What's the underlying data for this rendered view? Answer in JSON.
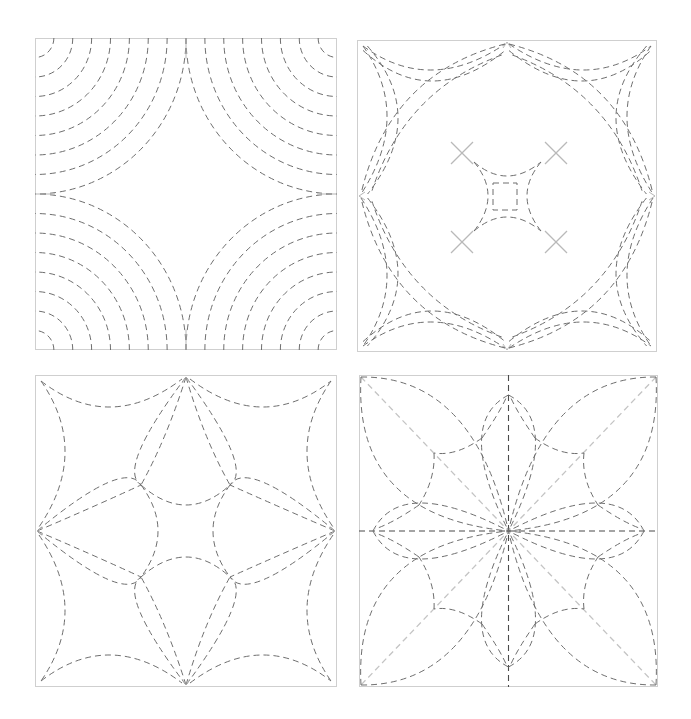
{
  "figure": {
    "line_style": "dashed",
    "colors": {
      "frame": "#cfcfcf",
      "stitch": "#6e6e6e",
      "stitch_dark": "#4a4a4a",
      "guide_light": "#c4c4c4",
      "registration_mark": "#b9b9b9"
    }
  },
  "panels": [
    {
      "id": "panel-1",
      "name": "concentric-corner-arcs",
      "position": "top-left",
      "box": {
        "x": 35,
        "y": 38,
        "w": 302,
        "h": 312
      },
      "motif": "Concentric quarter-circle arcs radiating from each of the four corners, leaving a central four-pointed concave diamond",
      "arcs_per_corner": 8
    },
    {
      "id": "panel-2",
      "name": "double-line-star-with-center-square",
      "position": "top-right",
      "box": {
        "x": 357,
        "y": 40,
        "w": 300,
        "h": 312
      },
      "motif": "Double-line concave arcs along each edge and between edge midpoints forming a four-pointed star, a concave central square with a small inner square, and four X registration marks on the diagonals",
      "registration_marks": 4
    },
    {
      "id": "panel-3",
      "name": "petal-star",
      "position": "bottom-left",
      "box": {
        "x": 35,
        "y": 375,
        "w": 302,
        "h": 312
      },
      "motif": "Single concave edge arcs from corners to midpoints, lens-shaped petals from each edge midpoint to the inner junctions, and a concave central square"
    },
    {
      "id": "panel-4",
      "name": "eight-point-flower",
      "position": "bottom-right",
      "box": {
        "x": 359,
        "y": 375,
        "w": 299,
        "h": 312
      },
      "motif": "Four diagonal corner leaves, narrow spikes toward each edge midpoint, an eight-point star outline, dark center cross lines and light diagonal guide lines"
    }
  ]
}
